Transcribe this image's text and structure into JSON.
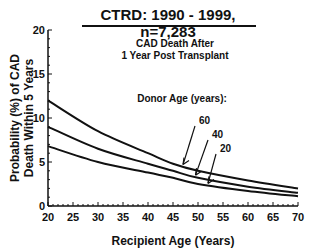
{
  "header": {
    "title": "CTRD:  1990 - 1999, n=7,283"
  },
  "chart_data": {
    "type": "line",
    "title": "CTRD:  1990 - 1999, n=7,283",
    "subtitle": "CAD Death After 1 Year Post Transplant",
    "subtitle_line1": "CAD Death After",
    "subtitle_line2": "1 Year Post Transplant",
    "xlabel": "Recipient Age (Years)",
    "ylabel": "Probability (%) of CAD Death Within 5 Years",
    "ylabel_line1": "Probability (%) of CAD",
    "ylabel_line2": "Death Within 5 Years",
    "xlim": [
      20,
      70
    ],
    "ylim": [
      0,
      20
    ],
    "xticks": [
      20,
      25,
      30,
      35,
      40,
      45,
      50,
      55,
      60,
      65,
      70
    ],
    "yticks": [
      0,
      5,
      10,
      15,
      20
    ],
    "grid": false,
    "legend_title": "Donor Age (years):",
    "x": [
      20,
      30,
      40,
      45,
      50,
      60,
      70
    ],
    "series": [
      {
        "name": "60",
        "values": [
          12.0,
          8.5,
          6.0,
          4.8,
          4.0,
          2.9,
          2.0
        ]
      },
      {
        "name": "40",
        "values": [
          9.0,
          6.5,
          4.8,
          4.0,
          3.2,
          2.2,
          1.5
        ]
      },
      {
        "name": "20",
        "values": [
          6.8,
          5.0,
          3.8,
          3.2,
          2.5,
          1.7,
          1.1
        ]
      }
    ]
  }
}
